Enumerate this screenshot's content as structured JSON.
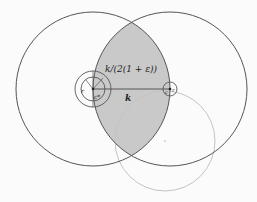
{
  "diagram": {
    "labels": {
      "radius_label": "k/(2(1 + ε))",
      "distance_label": "k",
      "left_r": "r",
      "left_c": "c*",
      "right_r": "r",
      "right_c": "c"
    },
    "colors": {
      "lens_fill": "#c9c9c9",
      "stroke": "#555555",
      "faint_stroke": "#c4c4c4",
      "background": "#fbfbfb"
    },
    "shapes": {
      "left_circle": {
        "cx": 93,
        "cy": 89,
        "r": 77
      },
      "right_circle": {
        "cx": 170,
        "cy": 89,
        "r": 77
      },
      "faint_circle": {
        "cx": 165,
        "cy": 141,
        "r": 50
      },
      "left_small_inner": {
        "cx": 93,
        "cy": 89,
        "r": 12
      },
      "left_small_outer": {
        "cx": 93,
        "cy": 89,
        "r": 18
      },
      "right_small": {
        "cx": 170,
        "cy": 89,
        "r": 7
      }
    }
  }
}
